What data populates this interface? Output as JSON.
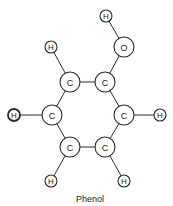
{
  "title": "Phenol",
  "colors": {
    "stroke": "#2a2a2a",
    "text": "#222222",
    "background": "#ffffff"
  },
  "atoms": [
    {
      "id": "h_oh",
      "label": "H",
      "x": 106,
      "y": 16,
      "r": 6
    },
    {
      "id": "o",
      "label": "O",
      "x": 124,
      "y": 47,
      "r": 10
    },
    {
      "id": "h_ul",
      "label": "H",
      "x": 51,
      "y": 47,
      "r": 6
    },
    {
      "id": "c1",
      "label": "C",
      "x": 70,
      "y": 82,
      "r": 10
    },
    {
      "id": "c2",
      "label": "C",
      "x": 105,
      "y": 82,
      "r": 10
    },
    {
      "id": "h_l",
      "label": "H",
      "x": 14,
      "y": 115,
      "r": 6,
      "bold": true
    },
    {
      "id": "c6",
      "label": "C",
      "x": 52,
      "y": 115,
      "r": 10
    },
    {
      "id": "c3",
      "label": "C",
      "x": 124,
      "y": 115,
      "r": 10
    },
    {
      "id": "h_r",
      "label": "H",
      "x": 160,
      "y": 115,
      "r": 6
    },
    {
      "id": "c5",
      "label": "C",
      "x": 70,
      "y": 147,
      "r": 10
    },
    {
      "id": "c4",
      "label": "C",
      "x": 105,
      "y": 147,
      "r": 10
    },
    {
      "id": "h_bl",
      "label": "H",
      "x": 51,
      "y": 181,
      "r": 6
    },
    {
      "id": "h_br",
      "label": "H",
      "x": 124,
      "y": 181,
      "r": 6
    }
  ],
  "bonds": [
    [
      "h_oh",
      "o"
    ],
    [
      "o",
      "c2"
    ],
    [
      "h_ul",
      "c1"
    ],
    [
      "c1",
      "c2"
    ],
    [
      "c2",
      "c3"
    ],
    [
      "c3",
      "c4"
    ],
    [
      "c4",
      "c5"
    ],
    [
      "c5",
      "c6"
    ],
    [
      "c6",
      "c1"
    ],
    [
      "h_l",
      "c6"
    ],
    [
      "c3",
      "h_r"
    ],
    [
      "c5",
      "h_bl"
    ],
    [
      "c4",
      "h_br"
    ]
  ],
  "caption": {
    "text": "Phenol",
    "x": 90,
    "y": 202
  }
}
